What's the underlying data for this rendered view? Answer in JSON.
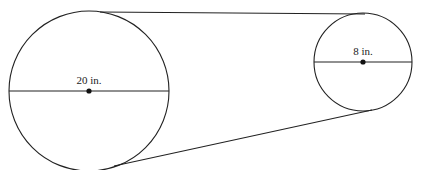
{
  "diagram": {
    "type": "belt-and-pulleys",
    "large_circle": {
      "label": "20 in.",
      "diameter": 20
    },
    "small_circle": {
      "label": "8 in.",
      "diameter": 8
    }
  }
}
